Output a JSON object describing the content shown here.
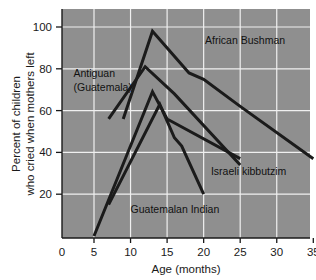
{
  "chart_data": {
    "type": "line",
    "title": "",
    "xlabel": "Age (months)",
    "ylabel": "Percent of children who cried when mothers left",
    "ylabel_line1": "Percent of children",
    "ylabel_line2": "who cried when mothers left",
    "xlim": [
      0,
      35
    ],
    "ylim": [
      0,
      110
    ],
    "xticks": [
      0,
      5,
      10,
      15,
      20,
      25,
      30,
      35
    ],
    "xtick_labels": [
      "0",
      "5",
      "10",
      "15",
      "20",
      "25",
      "30",
      "35"
    ],
    "yticks": [
      20,
      40,
      60,
      80,
      100
    ],
    "ytick_labels": [
      "20",
      "40",
      "60",
      "80",
      "100"
    ],
    "grid": true,
    "grid_color": "#f0f0f0",
    "plot_bg_color": "#8f8f8f",
    "line_color": "#1b1b1b",
    "legend": "inline-labels",
    "series": [
      {
        "name": "African Bushman",
        "label": "African Bushman",
        "label_x": 20.2,
        "label_y": 92,
        "points": [
          [
            9,
            56
          ],
          [
            13,
            98
          ],
          [
            18,
            78
          ],
          [
            20,
            75
          ],
          [
            25,
            62
          ],
          [
            35,
            37
          ]
        ]
      },
      {
        "name": "Antiguan (Guatemala)",
        "label": "Antiguan\n(Guatemala)",
        "label_line1": "Antiguan",
        "label_line2": "(Guatemala)",
        "label_x": 2.2,
        "label_y": 76,
        "points": [
          [
            7,
            56
          ],
          [
            12,
            81
          ],
          [
            16,
            68
          ],
          [
            25,
            34
          ]
        ]
      },
      {
        "name": "Israeli kibbutzim",
        "label": "Israeli kibbutzim",
        "label_x": 21.0,
        "label_y": 29,
        "points": [
          [
            5,
            0
          ],
          [
            13,
            69
          ],
          [
            15,
            56
          ],
          [
            25,
            37
          ]
        ]
      },
      {
        "name": "Guatemalan Indian",
        "label": "Guatemalan Indian",
        "label_x": 10.0,
        "label_y": 11,
        "points": [
          [
            7,
            15
          ],
          [
            14,
            63
          ],
          [
            16,
            47
          ],
          [
            17,
            43
          ],
          [
            20,
            20
          ]
        ]
      }
    ]
  },
  "figure": {
    "caption": ""
  }
}
